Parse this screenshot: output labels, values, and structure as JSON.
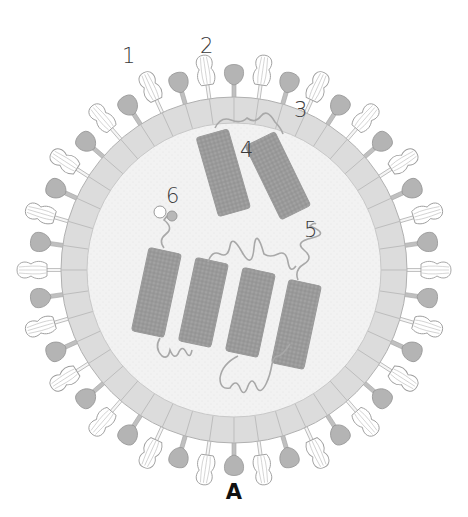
{
  "figure": {
    "panel_label": "A",
    "labels": [
      {
        "id": "1",
        "text": "1",
        "x": 122,
        "y": 46
      },
      {
        "id": "2",
        "text": "2",
        "x": 200,
        "y": 36
      },
      {
        "id": "3",
        "text": "3",
        "x": 294,
        "y": 100
      },
      {
        "id": "4",
        "text": "4",
        "x": 240,
        "y": 140
      },
      {
        "id": "5",
        "text": "5",
        "x": 304,
        "y": 220
      },
      {
        "id": "6",
        "text": "6",
        "x": 166,
        "y": 186
      }
    ],
    "colors": {
      "background": "#ffffff",
      "membrane": "#dcdcdc",
      "membrane_line": "#b5b5b5",
      "interior": "#f1f1f1",
      "rnp": "#9c9c9c",
      "rnp_dark": "#8a8a8a",
      "knob": "#b3b3b3",
      "spike_outline": "#a8a8a8",
      "text": "#333333"
    },
    "geometry": {
      "cx": 234,
      "cy": 270,
      "membrane_outer_r": 173,
      "membrane_inner_r": 147,
      "spike_count": 44
    }
  }
}
